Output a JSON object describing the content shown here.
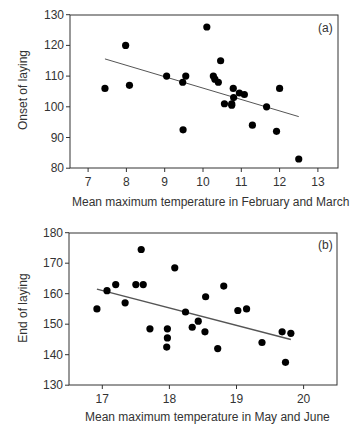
{
  "chart_data": [
    {
      "type": "scatter",
      "panel_label": "(a)",
      "title": "",
      "xlabel": "Mean maximum temperature in February and March",
      "ylabel": "Onset of laying",
      "xlim": [
        6.5,
        13.5
      ],
      "ylim": [
        80,
        130
      ],
      "xticks": [
        7,
        8,
        9,
        10,
        11,
        12,
        13
      ],
      "yticks": [
        80,
        90,
        100,
        110,
        120,
        130
      ],
      "grid": false,
      "legend": "none",
      "points": [
        {
          "x": 7.44,
          "y": 106
        },
        {
          "x": 7.98,
          "y": 120
        },
        {
          "x": 8.08,
          "y": 107
        },
        {
          "x": 9.05,
          "y": 110
        },
        {
          "x": 9.47,
          "y": 108
        },
        {
          "x": 9.55,
          "y": 110
        },
        {
          "x": 9.48,
          "y": 92.5
        },
        {
          "x": 10.1,
          "y": 126
        },
        {
          "x": 10.27,
          "y": 110
        },
        {
          "x": 10.31,
          "y": 109
        },
        {
          "x": 10.4,
          "y": 108
        },
        {
          "x": 10.46,
          "y": 115
        },
        {
          "x": 10.56,
          "y": 101
        },
        {
          "x": 10.75,
          "y": 101
        },
        {
          "x": 10.75,
          "y": 100.5
        },
        {
          "x": 10.79,
          "y": 106
        },
        {
          "x": 10.8,
          "y": 103
        },
        {
          "x": 10.95,
          "y": 104.5
        },
        {
          "x": 11.08,
          "y": 104
        },
        {
          "x": 11.29,
          "y": 94
        },
        {
          "x": 11.66,
          "y": 100
        },
        {
          "x": 11.92,
          "y": 92
        },
        {
          "x": 12.0,
          "y": 106
        },
        {
          "x": 12.5,
          "y": 83
        }
      ],
      "trendline": {
        "x": [
          7.44,
          12.5
        ],
        "y": [
          115.6,
          96.8
        ]
      }
    },
    {
      "type": "scatter",
      "panel_label": "(b)",
      "title": "",
      "xlabel": "Mean maximum temperature in May and June",
      "ylabel": "End of laying",
      "xlim": [
        16.5,
        20.5
      ],
      "ylim": [
        130,
        180
      ],
      "xticks": [
        17,
        18,
        19,
        20
      ],
      "yticks": [
        130,
        140,
        150,
        160,
        170,
        180
      ],
      "grid": false,
      "legend": "none",
      "points": [
        {
          "x": 16.92,
          "y": 155
        },
        {
          "x": 17.07,
          "y": 161
        },
        {
          "x": 17.2,
          "y": 163
        },
        {
          "x": 17.34,
          "y": 157
        },
        {
          "x": 17.5,
          "y": 163
        },
        {
          "x": 17.58,
          "y": 174.5
        },
        {
          "x": 17.61,
          "y": 163
        },
        {
          "x": 17.71,
          "y": 148.5
        },
        {
          "x": 17.97,
          "y": 148.5
        },
        {
          "x": 17.97,
          "y": 145.5
        },
        {
          "x": 17.96,
          "y": 142.5
        },
        {
          "x": 18.08,
          "y": 168.5
        },
        {
          "x": 18.24,
          "y": 154
        },
        {
          "x": 18.34,
          "y": 149
        },
        {
          "x": 18.43,
          "y": 151
        },
        {
          "x": 18.53,
          "y": 147.5
        },
        {
          "x": 18.54,
          "y": 159
        },
        {
          "x": 18.72,
          "y": 142
        },
        {
          "x": 18.81,
          "y": 162.5
        },
        {
          "x": 19.02,
          "y": 154.5
        },
        {
          "x": 19.15,
          "y": 155
        },
        {
          "x": 19.38,
          "y": 144
        },
        {
          "x": 19.68,
          "y": 147.5
        },
        {
          "x": 19.73,
          "y": 137.5
        },
        {
          "x": 19.81,
          "y": 147
        }
      ],
      "trendline": {
        "x": [
          16.92,
          19.81
        ],
        "y": [
          161.5,
          145
        ]
      }
    }
  ],
  "style": {
    "point_color": "#000000",
    "axis_color": "#333333",
    "trend_color": "#555555"
  }
}
